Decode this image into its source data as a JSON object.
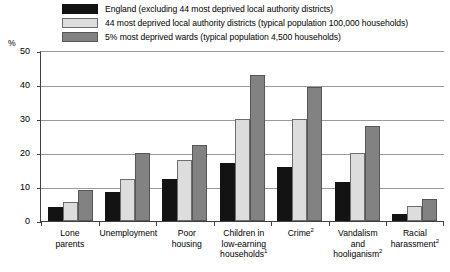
{
  "chart_data": {
    "type": "bar",
    "title": "",
    "xlabel": "",
    "ylabel": "%",
    "ylim": [
      0,
      50
    ],
    "yticks": [
      0,
      10,
      20,
      30,
      40,
      50
    ],
    "grid": true,
    "legend_position": "top",
    "categories": [
      "Lone parents",
      "Unemployment",
      "Poor housing",
      "Children in low-earning households",
      "Crime",
      "Vandalism and hooliganism",
      "Racial harassment"
    ],
    "category_footnotes": [
      "",
      "",
      "",
      "1",
      "2",
      "2",
      "2"
    ],
    "series": [
      {
        "name": "England (excluding 44 most deprived local authority districts)",
        "color": "#131313",
        "values": [
          4,
          8.5,
          12.5,
          17,
          16,
          11.5,
          2
        ]
      },
      {
        "name": "44 most deprived local authority districts (typical population 100,000 households)",
        "color": "#dddddd",
        "values": [
          5.5,
          12.5,
          18,
          30,
          30,
          20,
          4.5
        ]
      },
      {
        "name": "5% most deprived wards (typical population 4,500 households)",
        "color": "#828282",
        "values": [
          9,
          20,
          22.5,
          43,
          39.5,
          28,
          6.5
        ]
      }
    ]
  },
  "legend": {
    "items": [
      {
        "label": "England (excluding 44 most deprived local authority districts)",
        "swatch": "#131313"
      },
      {
        "label": "44 most deprived local authority districts (typical population 100,000 households)",
        "swatch": "#dddddd"
      },
      {
        "label": "5% most deprived wards (typical population 4,500 households)",
        "swatch": "#828282"
      }
    ]
  },
  "axes": {
    "y_unit": "%",
    "y_tick_labels": [
      "50",
      "40",
      "30",
      "20",
      "10",
      "0"
    ]
  },
  "x_axis_labels": [
    {
      "lines": [
        "Lone",
        "parents"
      ],
      "footnote": ""
    },
    {
      "lines": [
        "Unemployment"
      ],
      "footnote": ""
    },
    {
      "lines": [
        "Poor",
        "housing"
      ],
      "footnote": ""
    },
    {
      "lines": [
        "Children in",
        "low-earning",
        "households"
      ],
      "footnote": "1"
    },
    {
      "lines": [
        "Crime"
      ],
      "footnote": "2"
    },
    {
      "lines": [
        "Vandalism",
        "and",
        "hooliganism"
      ],
      "footnote": "2"
    },
    {
      "lines": [
        "Racial",
        "harassment"
      ],
      "footnote": "2"
    }
  ]
}
